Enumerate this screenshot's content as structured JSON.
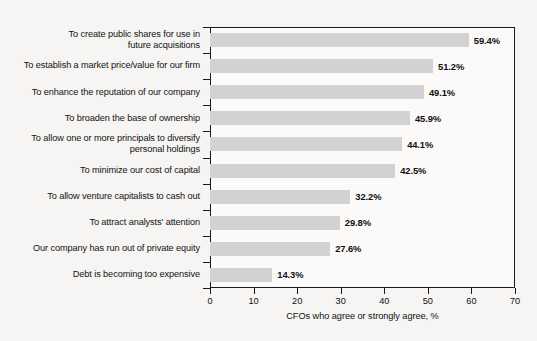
{
  "chart_data": {
    "type": "bar",
    "orientation": "horizontal",
    "title": "",
    "xlabel": "CFOs who agree or strongly agree, %",
    "ylabel": "",
    "xlim": [
      0,
      70
    ],
    "xticks": [
      0,
      10,
      20,
      30,
      40,
      50,
      60,
      70
    ],
    "grid": false,
    "legend": null,
    "bar_color": "#d2d2d2",
    "categories": [
      "To create public shares for use in future acquisitions",
      "To establish a market price/value for our firm",
      "To enhance the reputation of our company",
      "To broaden the base of ownership",
      "To allow one or more principals to diversify personal holdings",
      "To minimize our cost of capital",
      "To allow venture capitalists to cash out",
      "To attract analysts' attention",
      "Our company has run out of private equity",
      "Debt is becoming too expensive"
    ],
    "category_lines": [
      [
        "To create public shares for use in",
        "future acquisitions"
      ],
      [
        "To establish a market price/value for our firm"
      ],
      [
        "To enhance the reputation of our company"
      ],
      [
        "To broaden the base of ownership"
      ],
      [
        "To allow one or more principals to diversify",
        "personal holdings"
      ],
      [
        "To minimize our cost of capital"
      ],
      [
        "To allow venture capitalists to cash out"
      ],
      [
        "To attract analysts' attention"
      ],
      [
        "Our company has run out of private equity"
      ],
      [
        "Debt is becoming too expensive"
      ]
    ],
    "values": [
      59.4,
      51.2,
      49.1,
      45.9,
      44.1,
      42.5,
      32.2,
      29.8,
      27.6,
      14.3
    ],
    "value_labels": [
      "59.4%",
      "51.2%",
      "49.1%",
      "45.9%",
      "44.1%",
      "42.5%",
      "32.2%",
      "29.8%",
      "27.6%",
      "14.3%"
    ]
  }
}
